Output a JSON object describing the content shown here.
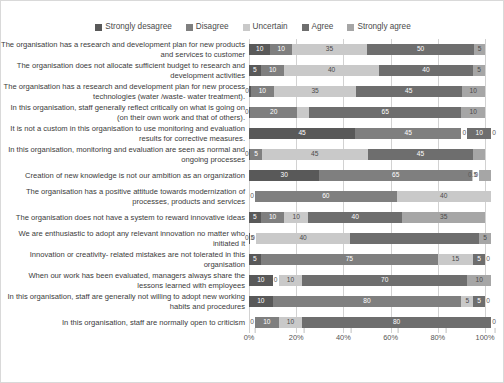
{
  "chart_data": {
    "type": "bar",
    "orientation": "horizontal",
    "stacked": true,
    "stack_mode": "percent",
    "title": "",
    "xlabel": "",
    "ylabel": "",
    "xlim": [
      0,
      100
    ],
    "xticks": [
      "0%",
      "20%",
      "40%",
      "60%",
      "80%",
      "100%"
    ],
    "xtick_values": [
      0,
      20,
      40,
      60,
      80,
      100
    ],
    "grid": true,
    "legend_position": "top",
    "series": [
      {
        "name": "Strongly desagree",
        "color": "#595959"
      },
      {
        "name": "Disagree",
        "color": "#7f7f7f"
      },
      {
        "name": "Uncertain",
        "color": "#c9c9c9"
      },
      {
        "name": "Agree",
        "color": "#6e6e6e"
      },
      {
        "name": "Strongly agree",
        "color": "#a6a6a6"
      }
    ],
    "categories": [
      "The organisation has a research and development plan for new products and services to customer",
      "The organisation does not allocate sufficient budget to research and development activities",
      "The organisation has a research and development plan for new process technologies (water /waste- water treatment).",
      "In this organisation, staff generally reflect critically on what is going on (on their own work and that of others).",
      "It is not a custom in this organisation to use monitoring and evaluation results for corrective measures.",
      "In this organisation, monitoring and evaluation are seen as normal and ongoing processes",
      "Creation of new knowledge is not our ambition as an organization",
      "The organisation has a positive attitude towards modernization of processes, products and services",
      "The organisation does not have a system to reward innovative ideas",
      "We are enthusiastic to adopt any relevant innovation no matter who initiated it",
      "Innovation or creativity- related mistakes are not tolerated in this organisation",
      "When our work has been evaluated, managers always share the lessons learned with employees",
      "In this organisation, staff are generally not willing to adopt new working habits and procedures",
      "In this organisation, staff are normally open to criticism"
    ],
    "rows": [
      {
        "values": [
          10,
          10,
          35,
          50,
          5
        ],
        "labels": [
          "10",
          "10",
          "35",
          "50",
          "5"
        ]
      },
      {
        "values": [
          5,
          10,
          40,
          40,
          5
        ],
        "labels": [
          "5",
          "10",
          "40",
          "40",
          "5"
        ]
      },
      {
        "values": [
          0.7,
          10,
          35,
          45,
          10
        ],
        "labels": [
          "0.7",
          "10",
          "35",
          "45",
          "10"
        ]
      },
      {
        "values": [
          0.5,
          20,
          5,
          65,
          10
        ],
        "labels": [
          "0.5",
          "20",
          "",
          "65",
          "10"
        ]
      },
      {
        "values": [
          45,
          45,
          0,
          10,
          0
        ],
        "labels": [
          "45",
          "45",
          "0",
          "10",
          "0"
        ]
      },
      {
        "values": [
          0.5,
          5,
          45,
          45,
          5
        ],
        "labels": [
          "0.5",
          "5",
          "45",
          "45",
          ""
        ]
      },
      {
        "values": [
          30,
          65,
          0.5,
          0,
          5
        ],
        "labels": [
          "30",
          "65",
          "0.5",
          "0",
          ""
        ]
      },
      {
        "values": [
          0,
          60,
          40,
          0,
          0
        ],
        "labels": [
          "0",
          "60",
          "40",
          "",
          ""
        ]
      },
      {
        "values": [
          5,
          10,
          10,
          40,
          35
        ],
        "labels": [
          "5",
          "10",
          "10",
          "40",
          "35"
        ]
      },
      {
        "values": [
          0.5,
          0,
          40,
          55,
          5
        ],
        "labels": [
          "0.5",
          "0",
          "40",
          "",
          "5"
        ]
      },
      {
        "values": [
          5,
          75,
          15,
          5,
          0
        ],
        "labels": [
          "5",
          "75",
          "15",
          "5",
          "0"
        ]
      },
      {
        "values": [
          10,
          0,
          10,
          70,
          10
        ],
        "labels": [
          "10",
          "0",
          "10",
          "70",
          "10"
        ]
      },
      {
        "values": [
          10,
          80,
          5,
          5,
          0
        ],
        "labels": [
          "10",
          "80",
          "5",
          "5",
          "0"
        ]
      },
      {
        "values": [
          0,
          10,
          10,
          80,
          0
        ],
        "labels": [
          "0",
          "10",
          "10",
          "80",
          "0"
        ]
      }
    ]
  }
}
